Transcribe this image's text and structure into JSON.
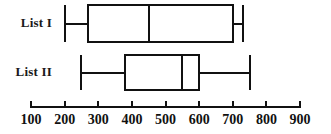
{
  "figure": {
    "type": "boxplot-figure",
    "background": "#ffffff",
    "line_color": "#111111",
    "width": 331,
    "height": 134
  },
  "axis": {
    "orientation": "horizontal",
    "min": 100,
    "max": 900,
    "tick_step": 100,
    "ticks": [
      100,
      200,
      300,
      400,
      500,
      600,
      700,
      800,
      900
    ],
    "tick_labels": [
      "100",
      "200",
      "300",
      "400",
      "500",
      "600",
      "700",
      "800",
      "900"
    ],
    "label": "",
    "px_min": 31,
    "px_max": 300
  },
  "rows": [
    {
      "label": "List I",
      "min": 200,
      "q1": 270,
      "median": 450,
      "q3": 700,
      "max": 730,
      "y_top": 5,
      "y_bottom": 42
    },
    {
      "label": "List II",
      "min": 250,
      "q1": 380,
      "median": 550,
      "q3": 600,
      "max": 750,
      "y_top": 55,
      "y_bottom": 90
    }
  ],
  "chart_data": {
    "type": "boxplot",
    "title": "",
    "xlabel": "",
    "ylabel": "",
    "orientation": "horizontal",
    "xlim": [
      100,
      900
    ],
    "xticks": [
      100,
      200,
      300,
      400,
      500,
      600,
      700,
      800,
      900
    ],
    "grid": false,
    "legend": "none",
    "categories": [
      "List I",
      "List II"
    ],
    "series": [
      {
        "name": "List I",
        "min": 200,
        "q1": 270,
        "median": 450,
        "q3": 700,
        "max": 730,
        "iqr": 430,
        "range": 530
      },
      {
        "name": "List II",
        "min": 250,
        "q1": 380,
        "median": 550,
        "q3": 600,
        "max": 750,
        "iqr": 220,
        "range": 500
      }
    ]
  }
}
